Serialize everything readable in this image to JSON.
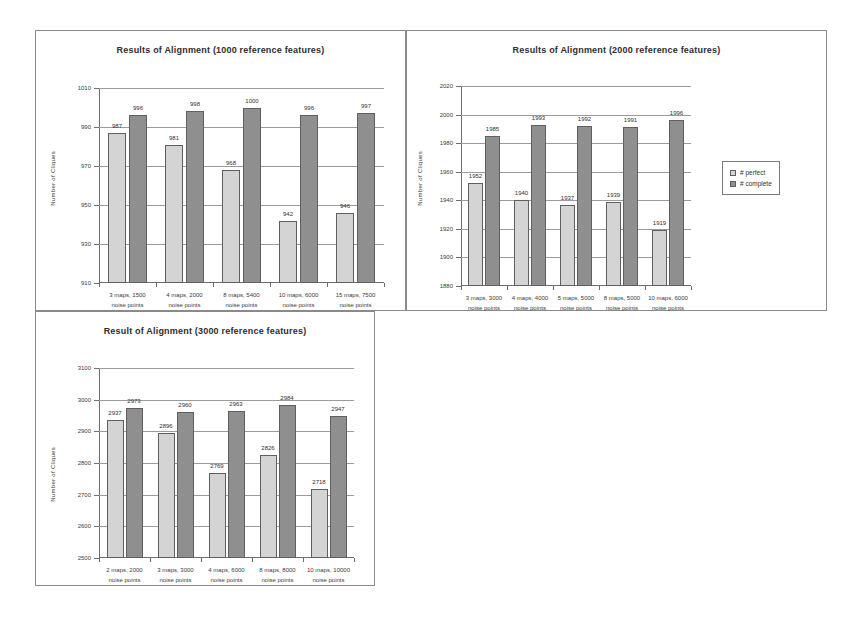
{
  "page": {
    "background": "#ffffff",
    "colors": {
      "perfect": "#d4d4d4",
      "complete": "#8f8f8f",
      "axis": "#6e6e6e",
      "grid": "#9b9b9b",
      "border": "#8a8a8a"
    }
  },
  "legend": {
    "perfect_label": "# perfect",
    "complete_label": "# complete",
    "position": "right-middle (chart 2)"
  },
  "chart_data": [
    {
      "id": "chart-1000",
      "type": "bar",
      "title": "Results of Alignment (1000 reference features)",
      "xlabel": "",
      "ylabel": "Number of Cliques",
      "ylim": [
        910,
        1010
      ],
      "yticks": [
        1010,
        990,
        970,
        950,
        930,
        910
      ],
      "grid": true,
      "legend": false,
      "categories": [
        "3 maps, 1500\nnoise points",
        "4 maps, 2000\nnoise points",
        "8 maps, 5400\nnoise points",
        "10 maps, 6000\nnoise points",
        "15 maps, 7500\nnoise points"
      ],
      "category_lines": [
        [
          "3 maps, 1500",
          "noise points"
        ],
        [
          "4 maps, 2000",
          "noise points"
        ],
        [
          "8 maps, 5400",
          "noise points"
        ],
        [
          "10 maps, 6000",
          "noise points"
        ],
        [
          "15 maps, 7500",
          "noise points"
        ]
      ],
      "series": [
        {
          "name": "# perfect",
          "values": [
            987,
            981,
            968,
            942,
            946
          ]
        },
        {
          "name": "# complete",
          "values": [
            996,
            998,
            1000,
            996,
            997
          ]
        }
      ]
    },
    {
      "id": "chart-2000",
      "type": "bar",
      "title": "Results of Alignment (2000 reference features)",
      "xlabel": "",
      "ylabel": "Number of Cliques",
      "ylim": [
        1880,
        2020
      ],
      "yticks": [
        2020,
        2000,
        1980,
        1960,
        1940,
        1920,
        1900,
        1880
      ],
      "grid": true,
      "legend": true,
      "categories": [
        "3 maps, 3000\nnoise points",
        "4 maps, 4000\nnoise points",
        "5 maps, 5000\nnoise points",
        "8 maps, 5000\nnoise points",
        "10 maps, 6000\nnoise points"
      ],
      "category_lines": [
        [
          "3 maps, 3000",
          "noise points"
        ],
        [
          "4 maps, 4000",
          "noise points"
        ],
        [
          "5 maps, 5000",
          "noise points"
        ],
        [
          "8 maps, 5000",
          "noise points"
        ],
        [
          "10 maps, 6000",
          "noise points"
        ]
      ],
      "series": [
        {
          "name": "# perfect",
          "values": [
            1952,
            1940,
            1937,
            1939,
            1919
          ]
        },
        {
          "name": "# complete",
          "values": [
            1985,
            1993,
            1992,
            1991,
            1996
          ]
        }
      ]
    },
    {
      "id": "chart-3000",
      "type": "bar",
      "title": "Result of Alignment (3000 reference features)",
      "xlabel": "",
      "ylabel": "Number of Cliques",
      "ylim": [
        2500,
        3100
      ],
      "yticks": [
        3100,
        3000,
        2900,
        2800,
        2700,
        2600,
        2500
      ],
      "grid": true,
      "legend": false,
      "categories": [
        "2 maps, 2000\nnoise points",
        "3 maps, 3000\nnoise points",
        "4 maps, 6000\nnoise points",
        "8 maps, 8000\nnoise points",
        "10 maps, 10000\nnoise points"
      ],
      "category_lines": [
        [
          "2 maps, 2000",
          "noise points"
        ],
        [
          "3 maps, 3000",
          "noise points"
        ],
        [
          "4 maps, 6000",
          "noise points"
        ],
        [
          "8 maps, 8000",
          "noise points"
        ],
        [
          "10 maps, 10000",
          "noise points"
        ]
      ],
      "series": [
        {
          "name": "# perfect",
          "values": [
            2937,
            2896,
            2769,
            2826,
            2718
          ]
        },
        {
          "name": "# complete",
          "values": [
            2973,
            2960,
            2963,
            2984,
            2947
          ]
        }
      ]
    }
  ]
}
